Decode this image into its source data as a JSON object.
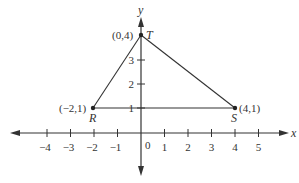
{
  "diagram": {
    "type": "coordinate-plane-triangle",
    "axes": {
      "x_label": "x",
      "y_label": "y",
      "origin_label": "0",
      "x_ticks": [
        {
          "value": -4,
          "label": "−4"
        },
        {
          "value": -3,
          "label": "−3"
        },
        {
          "value": -2,
          "label": "−2"
        },
        {
          "value": -1,
          "label": "−1"
        },
        {
          "value": 1,
          "label": "1"
        },
        {
          "value": 2,
          "label": "2"
        },
        {
          "value": 3,
          "label": "3"
        },
        {
          "value": 4,
          "label": "4"
        },
        {
          "value": 5,
          "label": "5"
        }
      ],
      "y_ticks": [
        {
          "value": 1,
          "label": "1"
        },
        {
          "value": 2,
          "label": "2"
        },
        {
          "value": 3,
          "label": "3"
        }
      ]
    },
    "points": {
      "T": {
        "name": "T",
        "coords": "(0,4)",
        "x": 0,
        "y": 4
      },
      "R": {
        "name": "R",
        "coords": "(−2,1)",
        "x": -2,
        "y": 1
      },
      "S": {
        "name": "S",
        "coords": "(4,1)",
        "x": 4,
        "y": 1
      }
    },
    "segments": [
      [
        "T",
        "R"
      ],
      [
        "T",
        "S"
      ],
      [
        "R",
        "S"
      ]
    ],
    "colors": {
      "line": "#333333",
      "background": "#ffffff"
    }
  }
}
